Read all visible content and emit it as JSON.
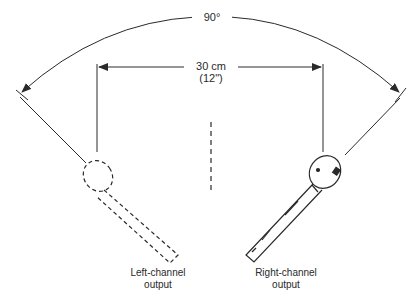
{
  "diagram": {
    "angle_label": "90°",
    "distance_label_line1": "30 cm",
    "distance_label_line2": "(12\")",
    "left_mic_caption_line1": "Left-channel",
    "left_mic_caption_line2": "output",
    "right_mic_caption_line1": "Right-channel",
    "right_mic_caption_line2": "output",
    "line_color": "#2a2a2a"
  }
}
